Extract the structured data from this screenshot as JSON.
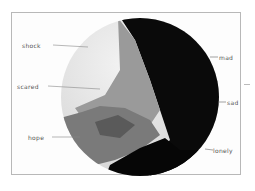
{
  "diagram": {
    "type": "emotion-circle",
    "labels": {
      "shock": "shock",
      "scared": "scared",
      "hope": "hope",
      "mad": "mad",
      "sad": "sad",
      "lonely": "lonely"
    },
    "colors": {
      "shock": "#e6e6e6",
      "scared": "#8a8a8a",
      "hope": "#6e6e6e",
      "mad": "#0a0a0a",
      "sad": "#1a1a1a",
      "lonely": "#080808"
    }
  }
}
